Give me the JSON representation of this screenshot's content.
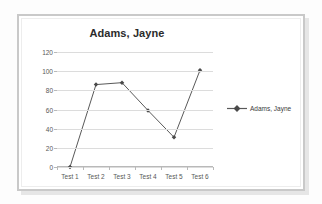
{
  "chart_data": {
    "type": "line",
    "title": "Adams, Jayne",
    "xlabel": "",
    "ylabel": "",
    "categories": [
      "Test 1",
      "Test 2",
      "Test 3",
      "Test 4",
      "Test 5",
      "Test 6"
    ],
    "series": [
      {
        "name": "Adams, Jayne",
        "values": [
          0,
          86,
          88,
          59,
          31,
          101
        ],
        "color": "#595959",
        "marker": "diamond"
      }
    ],
    "ylim": [
      0,
      120
    ],
    "ytick_interval": 20,
    "ytick_labels": [
      "120",
      "100",
      "80",
      "60",
      "40",
      "20",
      "0"
    ],
    "grid": true,
    "legend_position": "right",
    "legend_entries": [
      "Adams, Jayne"
    ]
  },
  "frame": {
    "border_color": "#c9c9c9",
    "background": "#ffffff"
  }
}
